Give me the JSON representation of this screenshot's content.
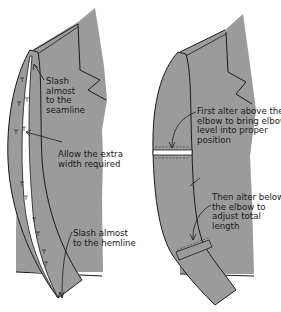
{
  "figure": {
    "left_panel": {
      "title": "Sleeve lengthened by slashing",
      "labels": [
        {
          "id": "slash-seamline",
          "text": "Slash\nalmost\nto the\nseamline"
        },
        {
          "id": "allow-width",
          "text": "Allow the extra\nwidth required"
        },
        {
          "id": "slash-hemline",
          "text": "Slash almost\nto the hemline"
        }
      ]
    },
    "right_panel": {
      "title": "Sleeve altered at elbow",
      "labels": [
        {
          "id": "alter-above-elbow",
          "text": "First alter above the\nelbow to bring elbow\nlevel into proper\nposition"
        },
        {
          "id": "alter-below-elbow",
          "text": "Then alter below\nthe elbow to\nadjust total\nlength"
        }
      ]
    },
    "colors": {
      "fabric": "#9b9b9b",
      "line": "#1a1a1a",
      "background": "#ffffff",
      "slash": "#ffffff"
    }
  }
}
